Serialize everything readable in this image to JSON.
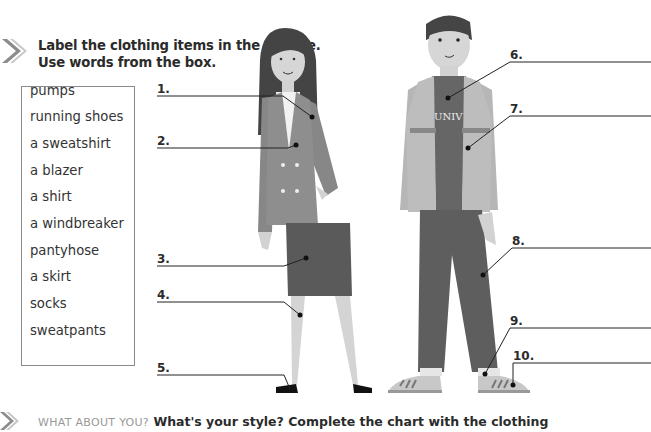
{
  "exercise": {
    "instruction_line1": "Label the clothing items in the picture.",
    "instruction_line2": "Use words from the box."
  },
  "word_box": {
    "words": [
      "pumps",
      "running shoes",
      "a sweatshirt",
      "a blazer",
      "a shirt",
      "a windbreaker",
      "pantyhose",
      "a skirt",
      "socks",
      "sweatpants"
    ]
  },
  "labels": [
    {
      "number": "1.",
      "answer": ""
    },
    {
      "number": "2.",
      "answer": ""
    },
    {
      "number": "3.",
      "answer": ""
    },
    {
      "number": "4.",
      "answer": ""
    },
    {
      "number": "5.",
      "answer": ""
    },
    {
      "number": "6.",
      "answer": ""
    },
    {
      "number": "7.",
      "answer": ""
    },
    {
      "number": "8.",
      "answer": ""
    },
    {
      "number": "9.",
      "answer": ""
    },
    {
      "number": "10.",
      "answer": ""
    }
  ],
  "figures": {
    "sweatshirt_text": "UNIV"
  },
  "next_exercise": {
    "caps_prefix": "WHAT ABOUT YOU?",
    "text": "What's your style? Complete the chart with the clothing"
  },
  "colors": {
    "arrow": "#8c8c8c",
    "line": "#3a3a3a",
    "blazer": "#8e8e8e",
    "skirt": "#5a5a5a",
    "sweatshirt": "#666666",
    "windbreaker": "#b4b4b4",
    "sweatpants": "#5e5e5e",
    "skin": "#d4d4d4",
    "hair": "#444444"
  }
}
